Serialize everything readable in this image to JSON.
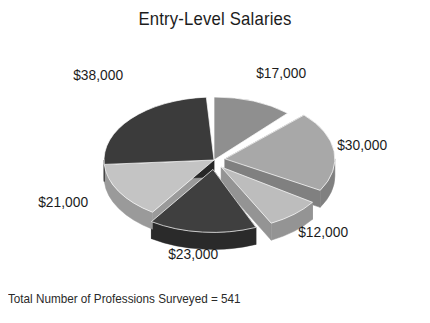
{
  "chart_data": {
    "type": "pie",
    "title": "Entry-Level Salaries",
    "subtitle": "",
    "xlabel": "",
    "ylabel": "",
    "legend_position": "none",
    "grid": false,
    "style": "3d-exploded-pie",
    "footer_note": "Total Number of Professions Surveyed = 541",
    "total_professions_surveyed": 541,
    "labels": [
      "$17,000",
      "$30,000",
      "$12,000",
      "$23,000",
      "$21,000",
      "$38,000"
    ],
    "values": [
      17000,
      30000,
      12000,
      23000,
      21000,
      38000
    ],
    "slices": [
      {
        "label": "$17,000",
        "value": 17000,
        "color": "#8f8f8f",
        "side_color": "#6e6e6e",
        "start_angle": 0,
        "end_angle": 42,
        "exploded": false
      },
      {
        "label": "$30,000",
        "value": 30000,
        "color": "#a8a8a8",
        "side_color": "#808080",
        "start_angle": 46,
        "end_angle": 120,
        "exploded": true
      },
      {
        "label": "$12,000",
        "value": 12000,
        "color": "#bdbdbd",
        "side_color": "#949494",
        "start_angle": 124,
        "end_angle": 153,
        "exploded": true
      },
      {
        "label": "$23,000",
        "value": 23000,
        "color": "#3f3f3f",
        "side_color": "#2a2a2a",
        "start_angle": 157,
        "end_angle": 214,
        "exploded": true
      },
      {
        "label": "$21,000",
        "value": 21000,
        "color": "#c4c4c4",
        "side_color": "#9a9a9a",
        "start_angle": 214,
        "end_angle": 266,
        "exploded": false
      },
      {
        "label": "$38,000",
        "value": 38000,
        "color": "#3b3b3b",
        "side_color": "#272727",
        "start_angle": 266,
        "end_angle": 356,
        "exploded": false
      }
    ]
  },
  "chart": {
    "title": "Entry-Level Salaries",
    "footer_note": "Total Number of Professions Surveyed = 541",
    "labels": {
      "l17000": "$17,000",
      "l30000": "$30,000",
      "l12000": "$12,000",
      "l23000": "$23,000",
      "l21000": "$21,000",
      "l38000": "$38,000"
    }
  },
  "colors": {
    "background": "#ffffff",
    "text": "#1c1c1c",
    "dark_slice": "#3b3b3b",
    "mid_slice": "#8f8f8f",
    "light_slice": "#c4c4c4"
  }
}
